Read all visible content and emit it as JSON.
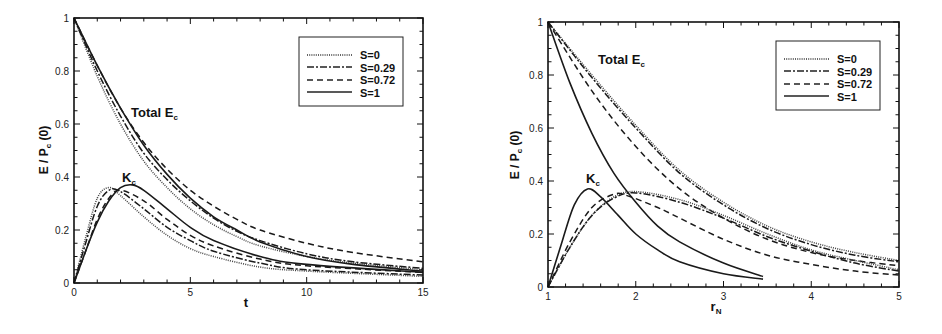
{
  "chart_data": [
    {
      "type": "line",
      "title": "",
      "xlabel": "t",
      "ylabel": "E / P_c (0)",
      "xlim": [
        0,
        15
      ],
      "ylim": [
        0,
        1
      ],
      "xticks": [
        "0",
        "5",
        "10",
        "15"
      ],
      "yticks": [
        "0",
        "0.2",
        "0.4",
        "0.6",
        "0.8",
        "1"
      ],
      "grid": false,
      "legend_position": "upper right",
      "annotations": [
        {
          "text": "Total  E",
          "subscript": "c",
          "x": 5.3,
          "y": 0.65
        },
        {
          "text": "K",
          "subscript": "c",
          "x": 2.1,
          "y": 0.39
        }
      ],
      "series": [
        {
          "name": "S=0",
          "style": "dotted",
          "group": "Total E_c",
          "x": [
            0,
            1,
            2,
            3,
            4,
            5,
            6,
            7,
            8,
            10,
            12,
            15
          ],
          "y": [
            1.0,
            0.78,
            0.6,
            0.46,
            0.36,
            0.28,
            0.22,
            0.175,
            0.14,
            0.1,
            0.075,
            0.05
          ]
        },
        {
          "name": "S=0.29",
          "style": "dashdot",
          "group": "Total E_c",
          "x": [
            0,
            1,
            2,
            3,
            4,
            5,
            6,
            7,
            8,
            10,
            12,
            15
          ],
          "y": [
            1.0,
            0.8,
            0.63,
            0.49,
            0.39,
            0.31,
            0.245,
            0.195,
            0.16,
            0.11,
            0.08,
            0.055
          ]
        },
        {
          "name": "S=0.72",
          "style": "dashed",
          "group": "Total E_c",
          "x": [
            0,
            1,
            2,
            3,
            4,
            5,
            6,
            7,
            8,
            10,
            12,
            15
          ],
          "y": [
            1.0,
            0.82,
            0.66,
            0.53,
            0.43,
            0.35,
            0.29,
            0.24,
            0.2,
            0.15,
            0.115,
            0.08
          ]
        },
        {
          "name": "S=1",
          "style": "solid",
          "group": "Total E_c",
          "x": [
            0,
            1,
            2,
            3,
            4,
            5,
            6,
            7,
            8,
            10,
            12,
            15
          ],
          "y": [
            1.0,
            0.82,
            0.66,
            0.52,
            0.41,
            0.32,
            0.25,
            0.2,
            0.155,
            0.1,
            0.07,
            0.045
          ]
        },
        {
          "name": "S=0",
          "style": "dotted",
          "group": "K_c",
          "x": [
            0,
            0.5,
            1,
            1.5,
            2,
            3,
            4,
            5,
            6,
            8,
            10,
            15
          ],
          "y": [
            0,
            0.17,
            0.32,
            0.36,
            0.33,
            0.25,
            0.18,
            0.13,
            0.1,
            0.06,
            0.045,
            0.025
          ]
        },
        {
          "name": "S=0.29",
          "style": "dashdot",
          "group": "K_c",
          "x": [
            0,
            0.5,
            1,
            1.5,
            2,
            3,
            4,
            5,
            6,
            8,
            10,
            15
          ],
          "y": [
            0,
            0.15,
            0.29,
            0.35,
            0.345,
            0.28,
            0.21,
            0.16,
            0.12,
            0.075,
            0.05,
            0.03
          ]
        },
        {
          "name": "S=0.72",
          "style": "dashed",
          "group": "K_c",
          "x": [
            0,
            0.5,
            1,
            1.5,
            2,
            3,
            4,
            5,
            6,
            8,
            10,
            15
          ],
          "y": [
            0,
            0.12,
            0.24,
            0.32,
            0.35,
            0.31,
            0.24,
            0.18,
            0.14,
            0.09,
            0.065,
            0.04
          ]
        },
        {
          "name": "S=1",
          "style": "solid",
          "group": "K_c",
          "x": [
            0,
            0.5,
            1,
            1.5,
            2,
            2.5,
            3,
            4,
            5,
            6,
            8,
            10,
            15
          ],
          "y": [
            0,
            0.12,
            0.23,
            0.31,
            0.36,
            0.37,
            0.35,
            0.28,
            0.21,
            0.16,
            0.1,
            0.07,
            0.04
          ]
        }
      ]
    },
    {
      "type": "line",
      "title": "",
      "xlabel": "r_N",
      "ylabel": "E / P_c (0)",
      "xlim": [
        1,
        5
      ],
      "ylim": [
        0,
        1
      ],
      "xticks": [
        "1",
        "2",
        "3",
        "4",
        "5"
      ],
      "yticks": [
        "0",
        "0.2",
        "0.4",
        "0.6",
        "0.8",
        "1"
      ],
      "grid": false,
      "legend_position": "upper right",
      "annotations": [
        {
          "text": "Total  E",
          "subscript": "c",
          "x": 1.6,
          "y": 0.86
        },
        {
          "text": "K",
          "subscript": "c",
          "x": 1.45,
          "y": 0.39
        }
      ],
      "series": [
        {
          "name": "S=0",
          "style": "dotted",
          "group": "Total E_c",
          "x": [
            1,
            1.5,
            2,
            2.5,
            3,
            3.5,
            4,
            4.5,
            5
          ],
          "y": [
            1.0,
            0.8,
            0.61,
            0.44,
            0.32,
            0.23,
            0.17,
            0.13,
            0.1
          ]
        },
        {
          "name": "S=0.29",
          "style": "dashdot",
          "group": "Total E_c",
          "x": [
            1,
            1.5,
            2,
            2.5,
            3,
            3.5,
            4,
            4.5,
            5
          ],
          "y": [
            1.0,
            0.79,
            0.6,
            0.43,
            0.31,
            0.22,
            0.16,
            0.12,
            0.095
          ]
        },
        {
          "name": "S=0.72",
          "style": "dashed",
          "group": "Total E_c",
          "x": [
            1,
            1.5,
            2,
            2.5,
            3,
            3.5,
            4,
            4.5,
            5
          ],
          "y": [
            1.0,
            0.74,
            0.53,
            0.37,
            0.26,
            0.18,
            0.13,
            0.1,
            0.08
          ]
        },
        {
          "name": "S=1",
          "style": "solid",
          "group": "Total E_c",
          "x": [
            1,
            1.25,
            1.5,
            1.75,
            2,
            2.25,
            2.5,
            3,
            3.45
          ],
          "y": [
            1.0,
            0.77,
            0.58,
            0.43,
            0.32,
            0.23,
            0.17,
            0.09,
            0.04
          ]
        },
        {
          "name": "S=0",
          "style": "dotted",
          "group": "K_c",
          "x": [
            1,
            1.25,
            1.5,
            1.75,
            2,
            2.5,
            3,
            3.5,
            4,
            4.5,
            5
          ],
          "y": [
            0,
            0.15,
            0.27,
            0.34,
            0.36,
            0.33,
            0.27,
            0.2,
            0.14,
            0.1,
            0.065
          ]
        },
        {
          "name": "S=0.29",
          "style": "dashdot",
          "group": "K_c",
          "x": [
            1,
            1.25,
            1.5,
            1.75,
            2,
            2.5,
            3,
            3.5,
            4,
            4.5,
            5
          ],
          "y": [
            0,
            0.15,
            0.27,
            0.335,
            0.355,
            0.32,
            0.26,
            0.19,
            0.135,
            0.09,
            0.06
          ]
        },
        {
          "name": "S=0.72",
          "style": "dashed",
          "group": "K_c",
          "x": [
            1,
            1.25,
            1.5,
            1.75,
            1.9,
            2.25,
            2.5,
            3,
            3.5,
            4,
            4.5,
            5
          ],
          "y": [
            0,
            0.17,
            0.3,
            0.35,
            0.345,
            0.3,
            0.26,
            0.18,
            0.12,
            0.085,
            0.06,
            0.045
          ]
        },
        {
          "name": "S=1",
          "style": "solid",
          "group": "K_c",
          "x": [
            1,
            1.15,
            1.3,
            1.45,
            1.6,
            1.8,
            2,
            2.25,
            2.5,
            3,
            3.45
          ],
          "y": [
            0,
            0.16,
            0.31,
            0.37,
            0.34,
            0.27,
            0.2,
            0.14,
            0.095,
            0.05,
            0.03
          ]
        }
      ]
    }
  ],
  "charts": [
    {
      "xlabel": "t",
      "ylabel_main": "E / P",
      "ylabel_sub": "c",
      "ylabel_tail": " (0)",
      "annot_total": "Total   E",
      "annot_total_sub": "c",
      "annot_k": "K",
      "annot_k_sub": "c",
      "legend": [
        "S=0",
        "S=0.29",
        "S=0.72",
        "S=1"
      ]
    },
    {
      "xlabel": "r",
      "xlabel_sub": "N",
      "ylabel_main": "E / P",
      "ylabel_sub": "c",
      "ylabel_tail": " (0)",
      "annot_total": "Total   E",
      "annot_total_sub": "c",
      "annot_k": "K",
      "annot_k_sub": "c",
      "legend": [
        "S=0",
        "S=0.29",
        "S=0.72",
        "S=1"
      ]
    }
  ]
}
